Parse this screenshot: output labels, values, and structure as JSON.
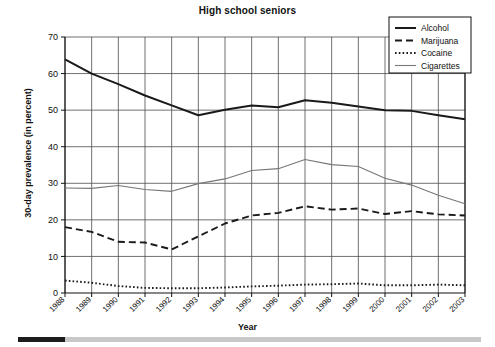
{
  "chart_data": {
    "type": "line",
    "title": "High school seniors",
    "xlabel": "Year",
    "ylabel": "30-day prevalence (in percent)",
    "categories": [
      "1988",
      "1989",
      "1990",
      "1991",
      "1992",
      "1993",
      "1994",
      "1995",
      "1996",
      "1997",
      "1998",
      "1999",
      "2000",
      "2001",
      "2002",
      "2003"
    ],
    "xlim": [
      1988,
      2003
    ],
    "ylim": [
      0,
      70
    ],
    "yticks": [
      0,
      10,
      20,
      30,
      40,
      50,
      60,
      70
    ],
    "grid": true,
    "legend_position": "top-right",
    "series": [
      {
        "name": "Alcohol",
        "style": "solid",
        "color": "#1a1a1a",
        "values": [
          63.9,
          60.0,
          57.1,
          54.0,
          51.3,
          48.6,
          50.1,
          51.3,
          50.8,
          52.7,
          52.0,
          51.0,
          50.0,
          49.8,
          48.6,
          47.5
        ]
      },
      {
        "name": "Marijuana",
        "style": "dashed",
        "color": "#1a1a1a",
        "values": [
          18.0,
          16.7,
          14.0,
          13.8,
          11.9,
          15.5,
          19.0,
          21.2,
          21.9,
          23.7,
          22.8,
          23.1,
          21.6,
          22.4,
          21.5,
          21.2
        ]
      },
      {
        "name": "Cocaine",
        "style": "dotted",
        "color": "#1a1a1a",
        "values": [
          3.4,
          2.8,
          1.9,
          1.4,
          1.3,
          1.3,
          1.5,
          1.8,
          2.0,
          2.3,
          2.4,
          2.6,
          2.1,
          2.1,
          2.3,
          2.1
        ]
      },
      {
        "name": "Cigarettes",
        "style": "thin-solid",
        "color": "#777777",
        "values": [
          28.7,
          28.6,
          29.4,
          28.3,
          27.8,
          29.9,
          31.2,
          33.5,
          34.0,
          36.5,
          35.1,
          34.6,
          31.4,
          29.5,
          26.7,
          24.4
        ]
      }
    ]
  },
  "scrollbar": {
    "thumb_position": "left",
    "track_color": "#c8c8c8",
    "thumb_color": "#1c1c1c"
  }
}
